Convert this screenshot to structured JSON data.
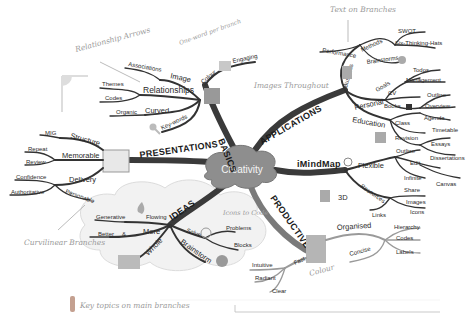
{
  "center": {
    "label": "Creativity"
  },
  "main_branches": [
    {
      "label": "BASICS",
      "children": [
        {
          "label": "Image",
          "children": [
            "Associations"
          ]
        },
        {
          "label": "Relationships",
          "children": [
            "Themes",
            "Codes"
          ]
        },
        {
          "label": "Curved",
          "children": [
            "Organic"
          ]
        },
        {
          "label": "Key-words",
          "children": []
        },
        {
          "label": "Colour",
          "children": [
            "Engaging"
          ]
        }
      ]
    },
    {
      "label": "APPLICATIONS",
      "children": [
        {
          "label": "Business",
          "children": [
            {
              "label": "Performance"
            },
            {
              "label": "Methods",
              "children": [
                "SWOT",
                "Six-Thinking-Hats"
              ]
            },
            {
              "label": "Brainstorms"
            }
          ]
        },
        {
          "label": "Personal",
          "children": [
            {
              "label": "Goals",
              "children": [
                "Todos",
                "Management"
              ]
            },
            {
              "label": "CV"
            },
            {
              "label": "Books",
              "children": [
                "Outline",
                "Overview"
              ]
            }
          ]
        },
        {
          "label": "Education",
          "children": [
            {
              "label": "Class",
              "children": [
                "Agenda",
                "Timetable"
              ]
            },
            {
              "label": "Revision"
            },
            {
              "label": "Outline",
              "children": [
                "Essays",
                "Dissertations"
              ]
            }
          ]
        }
      ]
    },
    {
      "label": "iMindMap",
      "children": [
        {
          "label": "Flexible",
          "children": [
            "Edit",
            "Infinite",
            "Canvas",
            "Share"
          ]
        },
        {
          "label": "3D"
        },
        {
          "label": "Resources",
          "children": [
            "Images",
            "Icons",
            "Links"
          ]
        }
      ]
    },
    {
      "label": "PRODUCTIVE",
      "children": [
        {
          "label": "Organised",
          "children": [
            "Hierarchy",
            "Codes",
            "Labels",
            "Concise"
          ]
        },
        {
          "label": "Fast",
          "children": [
            "Intuitive",
            "Radiant",
            "Clear"
          ]
        }
      ]
    },
    {
      "label": "IDEAS",
      "children": [
        {
          "label": "Flowing",
          "children": [
            "Generative"
          ]
        },
        {
          "label": "More",
          "children": [
            "Better",
            "&"
          ]
        },
        {
          "label": "Whole"
        },
        {
          "label": "Solve",
          "children": [
            "Problems",
            "Blocks"
          ]
        },
        {
          "label": "Brainstorm"
        }
      ]
    },
    {
      "label": "PRESENTATIONS",
      "children": [
        {
          "label": "Structure",
          "children": [
            "MIG"
          ]
        },
        {
          "label": "Memorable",
          "children": [
            "Repeat",
            "Review"
          ]
        },
        {
          "label": "Delivery",
          "children": [
            "Confidence",
            "Authoritative",
            "Personable"
          ]
        }
      ]
    }
  ],
  "annotations": {
    "relationship_arrows": "Relationship Arrows",
    "one_word": "One-word per branch",
    "images_throughout": "Images Throughout",
    "text_on_branches": "Text on Branches",
    "icons_code": "Icons to Code",
    "colour": "Colour",
    "curvilinear": "Curvilinear Branches",
    "key_topics": "Key topics on main branches"
  },
  "colors": {
    "branch": "#333333",
    "cloud": "#9e9e9e",
    "note": "#9a9a9a",
    "background": "#ffffff"
  }
}
